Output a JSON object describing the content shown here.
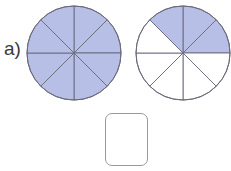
{
  "problem": {
    "label": "a)",
    "colors": {
      "shaded": "#b7bfe6",
      "unshaded": "#ffffff",
      "stroke": "#6a6a7a"
    },
    "circles": [
      {
        "name": "whole",
        "sectors": 8,
        "shaded_sectors": [
          0,
          1,
          2,
          3,
          4,
          5,
          6,
          7
        ]
      },
      {
        "name": "fraction",
        "sectors": 8,
        "shaded_sectors": [
          0,
          1,
          7
        ]
      }
    ],
    "answer_box": {
      "value": ""
    }
  }
}
